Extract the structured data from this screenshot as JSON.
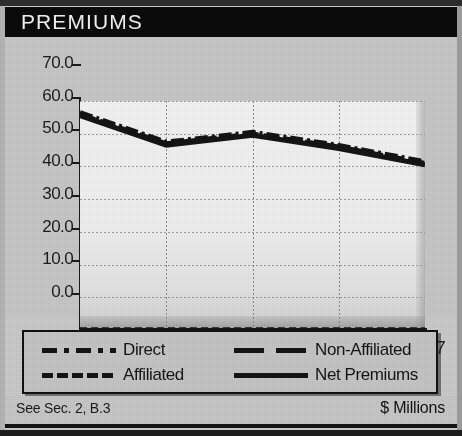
{
  "header": {
    "title": "PREMIUMS"
  },
  "footer": {
    "reference": "See Sec. 2, B.3",
    "units": "$ Millions"
  },
  "axes": {
    "y_ticks": [
      "70.0",
      "60.0",
      "50.0",
      "40.0",
      "30.0",
      "20.0",
      "10.0",
      "0.0"
    ],
    "x_ticks": [
      "2003",
      "2005",
      "2007"
    ]
  },
  "legend": {
    "items": [
      {
        "label": "Direct",
        "style": "dash-dot",
        "color": "#111111"
      },
      {
        "label": "Non-Affiliated",
        "style": "long-dash",
        "color": "#111111"
      },
      {
        "label": "Affiliated",
        "style": "short-dash",
        "color": "#111111"
      },
      {
        "label": "Net Premiums",
        "style": "solid",
        "color": "#111111"
      }
    ]
  },
  "chart_data": {
    "type": "line",
    "title": "PREMIUMS",
    "xlabel": "",
    "ylabel": "$ Millions",
    "x": [
      2003,
      2004,
      2005,
      2006,
      2007
    ],
    "categories": [
      "2003",
      "2004",
      "2005",
      "2006",
      "2007"
    ],
    "ylim": [
      0.0,
      70.0
    ],
    "xlim": [
      2003,
      2007
    ],
    "ytick_values": [
      70.0,
      60.0,
      50.0,
      40.0,
      30.0,
      20.0,
      10.0,
      0.0
    ],
    "xtick_values": [
      2003,
      2005,
      2007
    ],
    "xtick_labels": [
      "2003",
      "2005",
      "2007"
    ],
    "grid": true,
    "legend_position": "below",
    "series": [
      {
        "name": "Direct",
        "values": [
          66.5,
          57.5,
          60.5,
          56.5,
          51.5
        ]
      },
      {
        "name": "Non-Affiliated",
        "values": [
          66.0,
          57.0,
          60.0,
          56.0,
          51.0
        ]
      },
      {
        "name": "Affiliated",
        "values": [
          0.3,
          0.3,
          0.3,
          0.3,
          0.3
        ]
      },
      {
        "name": "Net Premiums",
        "values": [
          65.5,
          56.5,
          59.5,
          55.5,
          50.5
        ]
      }
    ]
  }
}
